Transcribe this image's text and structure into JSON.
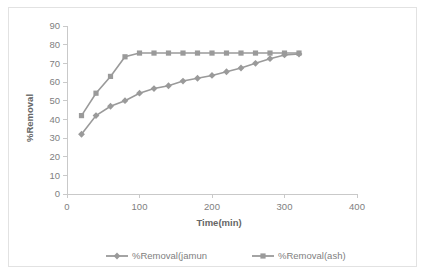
{
  "chart_data": {
    "type": "line",
    "title": "",
    "xlabel": "Time(min)",
    "ylabel": "%Removal",
    "xlim": [
      0,
      400
    ],
    "ylim": [
      0,
      90
    ],
    "xticks": [
      0,
      100,
      200,
      300,
      400
    ],
    "yticks": [
      0,
      10,
      20,
      30,
      40,
      50,
      60,
      70,
      80,
      90
    ],
    "xtick_labels": [
      "0",
      "100",
      "200",
      "300",
      "400"
    ],
    "ytick_labels": [
      "0",
      "10",
      "20",
      "30",
      "40",
      "50",
      "60",
      "70",
      "80",
      "90"
    ],
    "grid": false,
    "legend_position": "bottom",
    "x": [
      20,
      40,
      60,
      80,
      100,
      120,
      140,
      160,
      180,
      200,
      220,
      240,
      260,
      280,
      300,
      320
    ],
    "series": [
      {
        "name": "%Removal(jamun",
        "color": "#9a9a9a",
        "marker": "diamond",
        "values": [
          32,
          42,
          47,
          50,
          54,
          56.5,
          58,
          60.5,
          62,
          63.5,
          65.5,
          67.5,
          70,
          72.5,
          74.5,
          75
        ]
      },
      {
        "name": "%Removal(ash)",
        "color": "#9a9a9a",
        "marker": "square",
        "values": [
          42,
          54,
          63,
          73.5,
          75.5,
          75.5,
          75.5,
          75.5,
          75.5,
          75.5,
          75.5,
          75.5,
          75.5,
          75.5,
          75.5,
          75.5
        ]
      }
    ]
  },
  "colors": {
    "series_gray": "#9a9a9a",
    "axis_gray": "#c9c9c9",
    "text_gray": "#808080",
    "title_gray": "#666666",
    "frame_border": "#e2e2e2"
  }
}
